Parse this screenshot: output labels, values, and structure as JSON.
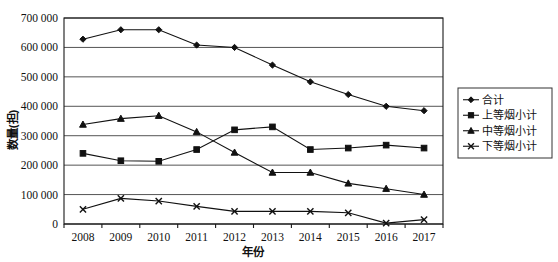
{
  "chart_data": {
    "type": "line",
    "title": "",
    "xlabel": "年份",
    "ylabel": "数量(担)",
    "categories": [
      "2008",
      "2009",
      "2010",
      "2011",
      "2012",
      "2013",
      "2014",
      "2015",
      "2016",
      "2017"
    ],
    "x": [
      2008,
      2009,
      2010,
      2011,
      2012,
      2013,
      2014,
      2015,
      2016,
      2017
    ],
    "ylim": [
      0,
      700000
    ],
    "ytick_values": [
      0,
      100000,
      200000,
      300000,
      400000,
      500000,
      600000,
      700000
    ],
    "ytick_labels": [
      "0",
      "100 000",
      "200 000",
      "300 000",
      "400 000",
      "500 000",
      "600 000",
      "700 000"
    ],
    "grid": true,
    "grid_axis": "y",
    "legend_position": "right-outside",
    "series": [
      {
        "name": "合计",
        "marker": "diamond",
        "values": [
          628000,
          660000,
          660000,
          608000,
          600000,
          540000,
          483000,
          440000,
          400000,
          385000
        ]
      },
      {
        "name": "上等烟小计",
        "marker": "square",
        "values": [
          240000,
          215000,
          213000,
          253000,
          320000,
          330000,
          253000,
          258000,
          268000,
          258000
        ]
      },
      {
        "name": "中等烟小计",
        "marker": "triangle",
        "values": [
          338000,
          358000,
          368000,
          313000,
          243000,
          175000,
          175000,
          138000,
          120000,
          100000
        ]
      },
      {
        "name": "下等烟小计",
        "marker": "cross",
        "values": [
          50000,
          87000,
          78000,
          60000,
          43000,
          43000,
          43000,
          38000,
          3000,
          15000
        ]
      }
    ]
  },
  "axes": {
    "y_title": "数量(担)",
    "x_title": "年份"
  }
}
